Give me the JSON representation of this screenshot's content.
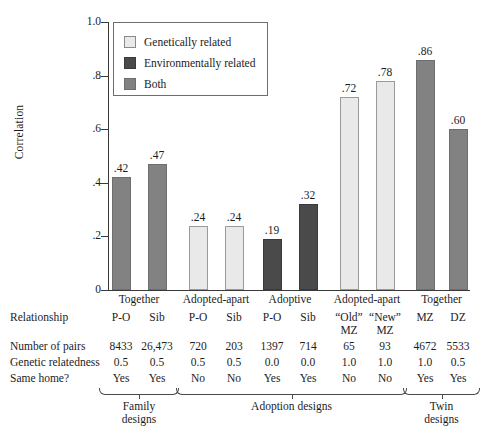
{
  "chart_data": {
    "type": "bar",
    "title": "",
    "xlabel": "",
    "ylabel": "Correlation",
    "ylim": [
      0,
      1.0
    ],
    "ytick_labels": [
      "0",
      ".2",
      ".4",
      ".6",
      ".8",
      "1.0"
    ],
    "ytick_values": [
      0,
      0.2,
      0.4,
      0.6,
      0.8,
      1.0
    ],
    "grid": false,
    "legend_position": "upper-left-inside",
    "categories": [
      "P-O",
      "Sib",
      "P-O",
      "Sib",
      "P-O",
      "Sib",
      "“Old” MZ",
      "“New” MZ",
      "MZ",
      "DZ"
    ],
    "values": [
      0.42,
      0.47,
      0.24,
      0.24,
      0.19,
      0.32,
      0.72,
      0.78,
      0.86,
      0.6
    ],
    "value_labels": [
      ".42",
      ".47",
      ".24",
      ".24",
      ".19",
      ".32",
      ".72",
      ".78",
      ".86",
      ".60"
    ],
    "bar_types": [
      "both",
      "both",
      "light",
      "light",
      "dark",
      "dark",
      "light",
      "light",
      "both",
      "both"
    ],
    "legend": [
      {
        "key": "light",
        "label": "Genetically related",
        "color": "#e9e9e9"
      },
      {
        "key": "dark",
        "label": "Environmentally related",
        "color": "#4a4a4a"
      },
      {
        "key": "both",
        "label": "Both",
        "color": "#828282"
      }
    ],
    "group_headers": [
      {
        "label": "Together",
        "span": [
          0,
          1
        ]
      },
      {
        "label": "Adopted-apart",
        "span": [
          2,
          3
        ]
      },
      {
        "label": "Adoptive",
        "span": [
          4,
          5
        ]
      },
      {
        "label": "Adopted-apart",
        "span": [
          6,
          7
        ]
      },
      {
        "label": "Together",
        "span": [
          8,
          9
        ]
      }
    ],
    "table": {
      "row_labels": [
        "Relationship",
        "Number of pairs",
        "Genetic relatedness",
        "Same home?"
      ],
      "rows": [
        {
          "label": "Relationship",
          "values": [
            "P-O",
            "Sib",
            "P-O",
            "Sib",
            "P-O",
            "Sib",
            "“Old”",
            "“New”",
            "MZ",
            "DZ"
          ],
          "values_line2": [
            "",
            "",
            "",
            "",
            "",
            "",
            "MZ",
            "MZ",
            "",
            ""
          ]
        },
        {
          "label": "Number of pairs",
          "values": [
            "8433",
            "26,473",
            "720",
            "203",
            "1397",
            "714",
            "65",
            "93",
            "4672",
            "5533"
          ]
        },
        {
          "label": "Genetic relatedness",
          "values": [
            "0.5",
            "0.5",
            "0.5",
            "0.5",
            "0.0",
            "0.0",
            "1.0",
            "1.0",
            "1.0",
            "0.5"
          ]
        },
        {
          "label": "Same home?",
          "values": [
            "Yes",
            "Yes",
            "No",
            "No",
            "Yes",
            "Yes",
            "No",
            "No",
            "Yes",
            "Yes"
          ]
        }
      ]
    },
    "design_brackets": [
      {
        "label_line1": "Family",
        "label_line2": "designs",
        "span": [
          0,
          1
        ]
      },
      {
        "label_line1": "Adoption designs",
        "label_line2": "",
        "span": [
          2,
          7
        ]
      },
      {
        "label_line1": "Twin",
        "label_line2": "designs",
        "span": [
          8,
          9
        ]
      }
    ],
    "colors": {
      "genetically_related": "#e9e9e9",
      "environmentally_related": "#4a4a4a",
      "both": "#828282",
      "axis": "#3a3a3a",
      "text": "#1c1c1c"
    }
  }
}
